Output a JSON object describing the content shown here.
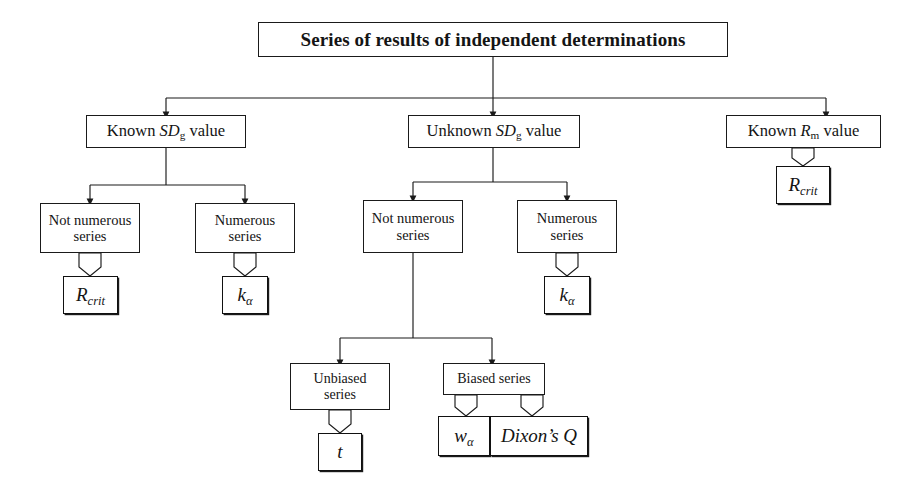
{
  "diagram": {
    "title": "Series of results of independent determinations",
    "root": {
      "label": "Series of results of independent determinations"
    },
    "level2": [
      {
        "id": "known-sdg",
        "prefix": "Known ",
        "sym": "SD",
        "sub": "g",
        "suffix": " value"
      },
      {
        "id": "unknown-sdg",
        "prefix": "Unknown ",
        "sym": "SD",
        "sub": "g",
        "suffix": " value"
      },
      {
        "id": "known-rm",
        "prefix": "Known ",
        "sym": "R",
        "sub": "m",
        "suffix": " value"
      }
    ],
    "branches": {
      "left_not_numerous": {
        "line1": "Not numerous",
        "line2": "series"
      },
      "left_numerous": {
        "line1": "Numerous",
        "line2": "series"
      },
      "mid_not_numerous": {
        "line1": "Not numerous",
        "line2": "series"
      },
      "mid_numerous": {
        "line1": "Numerous",
        "line2": "series"
      },
      "unbiased": {
        "line1": "Unbiased",
        "line2": "series"
      },
      "biased": {
        "line1": "Biased series"
      }
    },
    "terminals": {
      "r_crit_left": {
        "sym": "R",
        "sub": "crit"
      },
      "k_alpha_left": {
        "sym": "k",
        "sub": "α"
      },
      "k_alpha_mid": {
        "sym": "k",
        "sub": "α"
      },
      "r_crit_right": {
        "sym": "R",
        "sub": "crit"
      },
      "t_stat": {
        "sym": "t",
        "sub": ""
      },
      "w_alpha": {
        "sym": "w",
        "sub": "α"
      },
      "dixon_q": {
        "label": "Dixon’s Q"
      }
    },
    "colors": {
      "stroke": "#1a1a1a",
      "background": "#ffffff",
      "text": "#141414"
    }
  }
}
